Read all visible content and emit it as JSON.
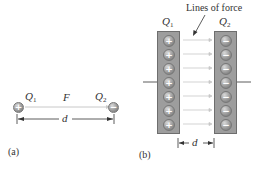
{
  "figure_a": {
    "caption": "(a)",
    "charge_1": {
      "label": "Q",
      "sub": "1",
      "sign": "+"
    },
    "charge_2": {
      "label": "Q",
      "sub": "2",
      "sign": "−"
    },
    "force_label": "F",
    "distance_label": "d"
  },
  "figure_b": {
    "caption": "(b)",
    "annotation": "Lines of force",
    "plate_1": {
      "label": "Q",
      "sub": "1",
      "sign": "+",
      "charge_count": 7
    },
    "plate_2": {
      "label": "Q",
      "sub": "2",
      "sign": "−",
      "charge_count": 7
    },
    "distance_label": "d"
  },
  "colors": {
    "plate_fill": "#9d9d9d",
    "plate_border": "#6e6e6e",
    "field_line": "#c8c8c8",
    "dimension_line": "#333333"
  }
}
